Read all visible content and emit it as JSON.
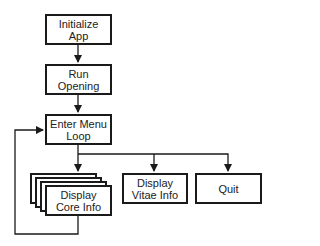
{
  "diagram": {
    "type": "flowchart",
    "nodes": {
      "init": {
        "label": "Initialize\nApp"
      },
      "run": {
        "label": "Run\nOpening"
      },
      "menu": {
        "label": "Enter Menu\nLoop"
      },
      "core": {
        "label": "Display\nCore Info",
        "stacked": true
      },
      "vitae": {
        "label": "Display\nVitae Info"
      },
      "quit": {
        "label": "Quit"
      }
    },
    "edges": [
      {
        "from": "init",
        "to": "run"
      },
      {
        "from": "run",
        "to": "menu"
      },
      {
        "from": "menu",
        "to": "core"
      },
      {
        "from": "menu",
        "to": "vitae"
      },
      {
        "from": "menu",
        "to": "quit"
      },
      {
        "from": "core",
        "to": "menu",
        "kind": "loop-back"
      }
    ],
    "colors": {
      "stroke": "#1a1a1a",
      "background": "#ffffff",
      "text": "#222222"
    }
  }
}
